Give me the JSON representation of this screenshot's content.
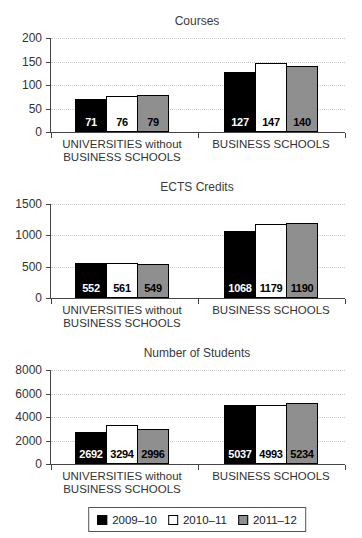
{
  "page": {
    "background": "#ffffff"
  },
  "chart_data": [
    {
      "type": "bar",
      "title": "Courses",
      "categories": [
        "UNIVERSITIES without\nBUSINESS SCHOOLS",
        "BUSINESS SCHOOLS"
      ],
      "series": [
        {
          "name": "2009–10",
          "color": "#000000",
          "values": [
            71,
            127
          ]
        },
        {
          "name": "2010–11",
          "color": "#ffffff",
          "values": [
            76,
            147
          ]
        },
        {
          "name": "2011–12",
          "color": "#8f8f8f",
          "values": [
            79,
            140
          ]
        }
      ],
      "ylim": [
        0,
        200
      ],
      "yticks": [
        0,
        50,
        100,
        150,
        200
      ],
      "grid": "horizontal-dotted",
      "value_labels": "inside-bottom"
    },
    {
      "type": "bar",
      "title": "ECTS Credits",
      "categories": [
        "UNIVERSITIES without\nBUSINESS SCHOOLS",
        "BUSINESS SCHOOLS"
      ],
      "series": [
        {
          "name": "2009–10",
          "color": "#000000",
          "values": [
            552,
            1068
          ]
        },
        {
          "name": "2010–11",
          "color": "#ffffff",
          "values": [
            561,
            1179
          ]
        },
        {
          "name": "2011–12",
          "color": "#8f8f8f",
          "values": [
            549,
            1190
          ]
        }
      ],
      "ylim": [
        0,
        1500
      ],
      "yticks": [
        0,
        500,
        1000,
        1500
      ],
      "grid": "horizontal-dotted",
      "value_labels": "inside-bottom"
    },
    {
      "type": "bar",
      "title": "Number of Students",
      "categories": [
        "UNIVERSITIES without\nBUSINESS SCHOOLS",
        "BUSINESS SCHOOLS"
      ],
      "series": [
        {
          "name": "2009–10",
          "color": "#000000",
          "values": [
            2692,
            5037
          ]
        },
        {
          "name": "2010–11",
          "color": "#ffffff",
          "values": [
            3294,
            4993
          ]
        },
        {
          "name": "2011–12",
          "color": "#8f8f8f",
          "values": [
            2996,
            5234
          ]
        }
      ],
      "ylim": [
        0,
        8000
      ],
      "yticks": [
        0,
        2000,
        4000,
        6000,
        8000
      ],
      "grid": "horizontal-dotted",
      "value_labels": "inside-bottom"
    }
  ],
  "legend": {
    "position": "bottom",
    "items": [
      {
        "label": "2009–10",
        "color": "#000000"
      },
      {
        "label": "2010–11",
        "color": "#ffffff"
      },
      {
        "label": "2011–12",
        "color": "#8f8f8f"
      }
    ]
  },
  "colors": {
    "axis": "#444444",
    "gridline": "#c8c8c8",
    "text": "#333333",
    "bar_border": "#000000"
  }
}
